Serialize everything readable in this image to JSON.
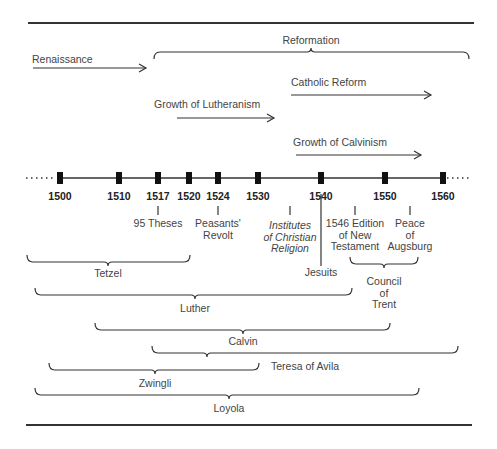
{
  "colors": {
    "line": "#333333",
    "text": "#444444",
    "tick": "#111111"
  },
  "frame": {
    "top_rule": {
      "x1": 28,
      "x2": 474,
      "y": 23
    },
    "bottom_rule": {
      "x1": 26,
      "x2": 472,
      "y": 425
    }
  },
  "timeline": {
    "y": 178,
    "x_start": 60,
    "x_end": 443,
    "dots_left": {
      "x1": 26,
      "x2": 56
    },
    "dots_right": {
      "x1": 447,
      "x2": 472
    },
    "ticks": [
      {
        "year": "1500",
        "x": 60
      },
      {
        "year": "1510",
        "x": 119
      },
      {
        "year": "1517",
        "x": 158
      },
      {
        "year": "1520",
        "x": 189
      },
      {
        "year": "1524",
        "x": 218
      },
      {
        "year": "1530",
        "x": 258
      },
      {
        "year": "1540",
        "x": 321
      },
      {
        "year": "1550",
        "x": 385
      },
      {
        "year": "1560",
        "x": 443
      }
    ]
  },
  "movements": [
    {
      "label": "Renaissance",
      "type": "arrow",
      "x1": 33,
      "x2": 146,
      "y": 68,
      "label_x": 32,
      "label_y": 63,
      "anchor": "start"
    },
    {
      "label": "Reformation",
      "type": "brace-down",
      "x1": 154,
      "x2": 469,
      "y": 52,
      "mid": 311,
      "label_x": 311,
      "label_y": 44
    },
    {
      "label": "Catholic Reform",
      "type": "arrow",
      "x1": 291,
      "x2": 431,
      "y": 95,
      "label_x": 291,
      "label_y": 86,
      "anchor": "start"
    },
    {
      "label": "Growth of Lutheranism",
      "type": "arrow",
      "x1": 177,
      "x2": 274,
      "y": 118,
      "label_x": 154,
      "label_y": 108,
      "anchor": "start"
    },
    {
      "label": "Growth of Calvinism",
      "type": "arrow",
      "x1": 296,
      "x2": 421,
      "y": 155,
      "label_x": 293,
      "label_y": 146,
      "anchor": "start"
    }
  ],
  "events": [
    {
      "label_lines": [
        "95 Theses"
      ],
      "italic": false,
      "x": 158,
      "line_y1": 206,
      "line_y2": 215,
      "label_y": 227
    },
    {
      "label_lines": [
        "Peasants'",
        "Revolt"
      ],
      "italic": false,
      "x": 218,
      "line_y1": 206,
      "line_y2": 215,
      "label_y": 227
    },
    {
      "label_lines": [
        "Institutes",
        "of Christian",
        "Religion"
      ],
      "italic": true,
      "x": 290,
      "line_y1": 206,
      "line_y2": 215,
      "label_y": 229
    },
    {
      "label_lines": [
        "Jesuits"
      ],
      "italic": false,
      "x": 321,
      "line_y1": 194,
      "line_y2": 266,
      "label_y": 276
    },
    {
      "label_lines": [
        "1546 Edition",
        "of New",
        "Testament"
      ],
      "italic": false,
      "x": 355,
      "line_y1": 206,
      "line_y2": 215,
      "label_y": 227
    },
    {
      "label_lines": [
        "Peace",
        "of",
        "Augsburg"
      ],
      "italic": false,
      "x": 410,
      "line_y1": 206,
      "line_y2": 215,
      "label_y": 227
    }
  ],
  "council": {
    "label_lines": [
      "Council",
      "of",
      "Trent"
    ],
    "x1": 350,
    "x2": 418,
    "y": 264,
    "mid": 384,
    "label_y": 285
  },
  "people": [
    {
      "label": "Tetzel",
      "x1": 27,
      "x2": 190,
      "y": 262,
      "mid": 108,
      "label_x": 108,
      "label_y": 277,
      "label_anchor": "middle"
    },
    {
      "label": "Luther",
      "x1": 35,
      "x2": 352,
      "y": 295,
      "mid": 195,
      "label_x": 195,
      "label_y": 312,
      "label_anchor": "middle"
    },
    {
      "label": "Calvin",
      "x1": 95,
      "x2": 390,
      "y": 330,
      "mid": 243,
      "label_x": 243,
      "label_y": 345,
      "label_anchor": "middle"
    },
    {
      "label": "Teresa of Avila",
      "x1": 152,
      "x2": 458,
      "y": 353,
      "mid": 207,
      "label_x": 271,
      "label_y": 370,
      "label_anchor": "start"
    },
    {
      "label": "Zwingli",
      "x1": 49,
      "x2": 259,
      "y": 370,
      "mid": 155,
      "label_x": 155,
      "label_y": 387,
      "label_anchor": "middle"
    },
    {
      "label": "Loyola",
      "x1": 35,
      "x2": 419,
      "y": 395,
      "mid": 229,
      "label_x": 229,
      "label_y": 412,
      "label_anchor": "middle"
    }
  ]
}
